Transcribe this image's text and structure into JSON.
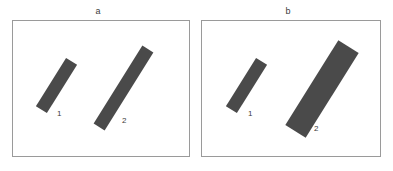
{
  "figure": {
    "type": "two-panel-bar-stimulus",
    "background_color": "#ffffff",
    "panel_border_color": "#9a9a9a",
    "bar_fill_color": "#4a4a4a",
    "label_color": "#3c3c3c",
    "width": 393,
    "height": 171
  },
  "chart_data": {
    "type": "table",
    "title": "",
    "panels": [
      {
        "caption": "a",
        "caption_x": 98,
        "caption_y": 7,
        "frame": {
          "x": 12,
          "y": 20,
          "width": 178,
          "height": 137
        },
        "bars": [
          {
            "label": "1",
            "length": 57,
            "width": 13,
            "angle_deg": 32,
            "center_x": 55,
            "center_y": 84,
            "label_x": 56,
            "label_y": 109
          },
          {
            "label": "2",
            "length": 92,
            "width": 13,
            "angle_deg": 32,
            "center_x": 122,
            "center_y": 87,
            "label_x": 121,
            "label_y": 116
          }
        ]
      },
      {
        "caption": "b",
        "caption_x": 288,
        "caption_y": 7,
        "frame": {
          "x": 201,
          "y": 20,
          "width": 180,
          "height": 137
        },
        "bars": [
          {
            "label": "1",
            "length": 57,
            "width": 13,
            "angle_deg": 32,
            "center_x": 245,
            "center_y": 84,
            "label_x": 247,
            "label_y": 109
          },
          {
            "label": "2",
            "length": 100,
            "width": 24,
            "angle_deg": 32,
            "center_x": 321,
            "center_y": 88,
            "label_x": 313,
            "label_y": 124
          }
        ]
      }
    ],
    "axes": {
      "x_visible": false,
      "y_visible": false,
      "grid": false
    },
    "legend": {
      "visible": false
    }
  }
}
